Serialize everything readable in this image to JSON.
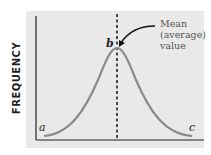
{
  "diagram": {
    "y_axis_label": "FREQUENCY",
    "annotation": [
      "Mean",
      "(average)",
      "value"
    ],
    "points": {
      "a": "a",
      "b": "b",
      "c": "c"
    },
    "colors": {
      "background": "#e9e9e9",
      "curve": "#8a8a8a",
      "axis": "#222222"
    }
  }
}
